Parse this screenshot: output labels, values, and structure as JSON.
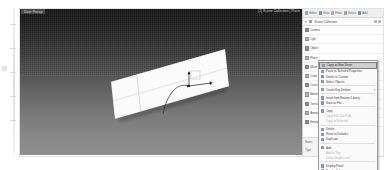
{
  "app": {
    "title": "3D Modeling Application",
    "viewport_label": "User Persp",
    "viewport_info": "(1) Scene Collection | Plane"
  },
  "viewport": {
    "object_name": "Plane",
    "gizmo": "rotate-gizmo",
    "background": "#5e5e5e",
    "object_color": "#fbfbfb"
  },
  "right_panel": {
    "toolbar": [
      {
        "label": "Editor",
        "icon": "editor-icon",
        "color": "#9aa4b0"
      },
      {
        "label": "View",
        "icon": "view-icon",
        "color": "#6f90c0"
      },
      {
        "label": "Filter",
        "icon": "filter-icon",
        "color": "#b0b0b0"
      },
      {
        "label": "Select",
        "icon": "select-icon",
        "color": "#9aa4b0"
      },
      {
        "label": "Add",
        "icon": "add-icon",
        "color": "#6f90c0"
      }
    ],
    "search": {
      "placeholder": "Search",
      "value": "Scene Collection",
      "icon": "collection-icon",
      "filter_icon": "filter-icon",
      "options_icon": "options-icon"
    },
    "tree_items": [
      {
        "label": "Camera",
        "icon": "camera-icon"
      },
      {
        "label": "Light",
        "icon": "light-icon"
      },
      {
        "label": "Object",
        "icon": "object-icon"
      },
      {
        "label": "Plane",
        "icon": "mesh-icon"
      },
      {
        "label": "Mesh",
        "icon": "mesh-data-icon"
      },
      {
        "label": "Cube",
        "icon": "cube-icon"
      },
      {
        "label": "Curve",
        "icon": "curve-icon"
      },
      {
        "label": "Material",
        "icon": "material-icon"
      },
      {
        "label": "Texture",
        "icon": "texture-icon"
      },
      {
        "label": "Armature",
        "icon": "armature-icon"
      },
      {
        "label": "Empty",
        "icon": "empty-icon"
      }
    ],
    "properties": [
      {
        "label": "Name",
        "value": "Plane"
      },
      {
        "label": "Type",
        "value": "Mesh"
      }
    ]
  },
  "context_menu": {
    "items": [
      {
        "label": "Copy as New Driver",
        "icon": "copy-driver-icon",
        "highlight": true,
        "separator_after": false,
        "submenu": false,
        "disabled": false
      },
      {
        "label": "Paste to Selected Properties",
        "icon": "paste-icon",
        "highlight": false,
        "separator_after": false,
        "submenu": false,
        "disabled": false
      },
      {
        "label": "Delete to Custom",
        "icon": "delete-icon",
        "highlight": false,
        "separator_after": false,
        "submenu": false,
        "disabled": false
      },
      {
        "label": "Select Objects",
        "icon": "select-objects-icon",
        "highlight": false,
        "separator_after": true,
        "submenu": false,
        "disabled": false
      },
      {
        "label": "Create Key Deform",
        "icon": "keyframe-icon",
        "highlight": false,
        "separator_after": true,
        "submenu": true,
        "disabled": false
      },
      {
        "label": "Insert from Nearest Library",
        "icon": "library-icon",
        "highlight": false,
        "separator_after": false,
        "submenu": false,
        "disabled": false
      },
      {
        "label": "Save as File...",
        "icon": "save-icon",
        "highlight": false,
        "separator_after": true,
        "submenu": false,
        "disabled": false
      },
      {
        "label": "Copy",
        "icon": "copy-icon",
        "highlight": false,
        "separator_after": false,
        "submenu": false,
        "disabled": false
      },
      {
        "label": "Copy Full Data Path",
        "icon": "none",
        "highlight": false,
        "separator_after": false,
        "submenu": false,
        "disabled": true
      },
      {
        "label": "Copy to Selected",
        "icon": "none",
        "highlight": false,
        "separator_after": true,
        "submenu": false,
        "disabled": true
      },
      {
        "label": "Delete",
        "icon": "delete-item-icon",
        "highlight": false,
        "separator_after": false,
        "submenu": false,
        "disabled": false
      },
      {
        "label": "Reset to Defaults",
        "icon": "reset-icon",
        "highlight": false,
        "separator_after": false,
        "submenu": false,
        "disabled": false
      },
      {
        "label": "Duplicate",
        "icon": "duplicate-icon",
        "highlight": false,
        "separator_after": true,
        "submenu": false,
        "disabled": false
      },
      {
        "label": "Add",
        "icon": "add-item-icon",
        "highlight": false,
        "separator_after": false,
        "submenu": false,
        "disabled": false
      },
      {
        "label": "Add to Tags",
        "icon": "none",
        "highlight": false,
        "separator_after": false,
        "submenu": false,
        "disabled": true
      },
      {
        "label": "Unlink Single Level",
        "icon": "none",
        "highlight": false,
        "separator_after": true,
        "submenu": false,
        "disabled": true
      },
      {
        "label": "Display Panel",
        "icon": "display-icon",
        "highlight": false,
        "separator_after": false,
        "submenu": false,
        "disabled": false
      },
      {
        "label": "Display Editor",
        "icon": "editor-display-icon",
        "highlight": false,
        "separator_after": false,
        "submenu": false,
        "disabled": false
      }
    ]
  }
}
